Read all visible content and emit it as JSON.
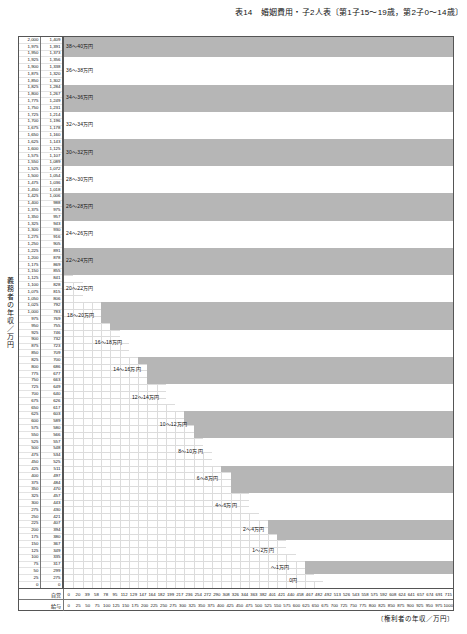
{
  "title": "表14　婚姻費用・子2人表〔第1子15〜19歳，第2子0〜14歳〕",
  "axes": {
    "y_caption": "義務者の年収／万円",
    "x_caption": "〔権利者の年収／万円〕",
    "y_col_headers": [
      "給与",
      "自営"
    ],
    "x_row_labels": [
      "自営",
      "給与"
    ]
  },
  "chart_data": {
    "type": "heatmap",
    "title": "表14　婚姻費用・子2人表〔第1子15〜19歳，第2子0〜14歳〕",
    "xlabel": "〔権利者の年収／万円〕",
    "ylabel": "義務者の年収／万円",
    "grid": true,
    "legend": "none",
    "y_salary": [
      2000,
      1975,
      1950,
      1925,
      1900,
      1875,
      1850,
      1825,
      1800,
      1775,
      1750,
      1725,
      1700,
      1675,
      1650,
      1625,
      1600,
      1575,
      1550,
      1525,
      1500,
      1475,
      1450,
      1425,
      1400,
      1375,
      1350,
      1325,
      1300,
      1275,
      1250,
      1225,
      1200,
      1175,
      1150,
      1125,
      1100,
      1075,
      1050,
      1025,
      1000,
      975,
      950,
      925,
      900,
      875,
      850,
      825,
      800,
      775,
      750,
      725,
      700,
      675,
      650,
      625,
      600,
      575,
      550,
      525,
      500,
      475,
      450,
      425,
      400,
      375,
      350,
      325,
      300,
      275,
      250,
      225,
      200,
      175,
      150,
      125,
      100,
      75,
      50,
      25,
      0
    ],
    "y_selfemployed": [
      1409,
      1391,
      1373,
      1356,
      1338,
      1320,
      1302,
      1284,
      1267,
      1249,
      1231,
      1214,
      1196,
      1178,
      1160,
      1143,
      1125,
      1107,
      1089,
      1072,
      1054,
      1036,
      1018,
      1006,
      988,
      975,
      957,
      943,
      930,
      916,
      905,
      891,
      878,
      869,
      855,
      841,
      828,
      815,
      806,
      792,
      783,
      769,
      755,
      746,
      732,
      723,
      709,
      700,
      686,
      677,
      663,
      649,
      640,
      626,
      617,
      603,
      589,
      580,
      566,
      557,
      548,
      534,
      525,
      511,
      497,
      484,
      470,
      457,
      443,
      430,
      421,
      407,
      394,
      380,
      367,
      349,
      335,
      317,
      299,
      275,
      0
    ],
    "x_selfemployed": [
      0,
      20,
      39,
      58,
      78,
      95,
      112,
      129,
      147,
      164,
      182,
      199,
      217,
      236,
      254,
      272,
      290,
      308,
      326,
      344,
      363,
      382,
      401,
      421,
      440,
      458,
      467,
      482,
      492,
      513,
      526,
      543,
      558,
      575,
      592,
      608,
      624,
      641,
      657,
      674,
      691,
      715
    ],
    "x_salary": [
      0,
      25,
      50,
      75,
      100,
      125,
      150,
      175,
      200,
      225,
      250,
      275,
      300,
      325,
      350,
      375,
      400,
      425,
      450,
      475,
      500,
      525,
      550,
      575,
      600,
      625,
      650,
      675,
      700,
      725,
      750,
      775,
      800,
      825,
      850,
      875,
      900,
      925,
      950,
      975,
      1000
    ],
    "bands": [
      {
        "label": "38〜40万円",
        "min": 38,
        "max": 40
      },
      {
        "label": "36〜38万円",
        "min": 36,
        "max": 38
      },
      {
        "label": "34〜36万円",
        "min": 34,
        "max": 36
      },
      {
        "label": "32〜34万円",
        "min": 32,
        "max": 34
      },
      {
        "label": "30〜32万円",
        "min": 30,
        "max": 32
      },
      {
        "label": "28〜30万円",
        "min": 28,
        "max": 30
      },
      {
        "label": "26〜28万円",
        "min": 26,
        "max": 28
      },
      {
        "label": "24〜26万円",
        "min": 24,
        "max": 26
      },
      {
        "label": "22〜24万円",
        "min": 22,
        "max": 24
      },
      {
        "label": "20〜22万円",
        "min": 20,
        "max": 22
      },
      {
        "label": "18〜20万円",
        "min": 18,
        "max": 20
      },
      {
        "label": "16〜18万円",
        "min": 16,
        "max": 18
      },
      {
        "label": "14〜16万円",
        "min": 14,
        "max": 16
      },
      {
        "label": "12〜14万円",
        "min": 12,
        "max": 14
      },
      {
        "label": "10〜12万円",
        "min": 10,
        "max": 12
      },
      {
        "label": "8〜10万円",
        "min": 8,
        "max": 10
      },
      {
        "label": "6〜8万円",
        "min": 6,
        "max": 8
      },
      {
        "label": "4〜6万円",
        "min": 4,
        "max": 6
      },
      {
        "label": "2〜4万円",
        "min": 2,
        "max": 4
      },
      {
        "label": "1〜2万円",
        "min": 1,
        "max": 2
      },
      {
        "label": "〜1万円",
        "min": 0,
        "max": 1
      },
      {
        "label": "0円",
        "min": 0,
        "max": 0
      }
    ],
    "band_label_rows": [
      1,
      5,
      10,
      15,
      20,
      25,
      30,
      35,
      40,
      45,
      50,
      55,
      60,
      63,
      66,
      69,
      71,
      73,
      75,
      76,
      77,
      79
    ],
    "colors": {
      "band_fill": "#b6b6b6",
      "band_empty": "#ffffff",
      "grid": "#dcdcdc",
      "border": "#555555"
    }
  }
}
